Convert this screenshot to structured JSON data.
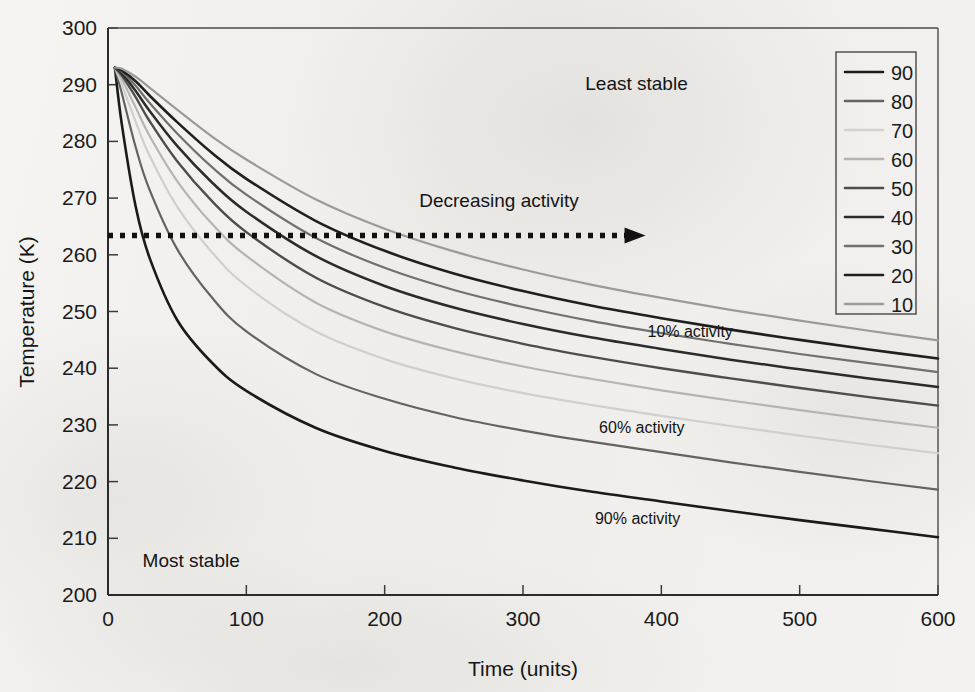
{
  "chart_data": {
    "type": "line",
    "title": "",
    "xlabel": "Time (units)",
    "ylabel": "Temperature (K)",
    "xlim": [
      0,
      600
    ],
    "ylim": [
      200,
      300
    ],
    "xticks": [
      "0",
      "100",
      "200",
      "300",
      "400",
      "500",
      "600"
    ],
    "yticks": [
      "200",
      "210",
      "220",
      "230",
      "240",
      "250",
      "260",
      "270",
      "280",
      "290",
      "300"
    ],
    "grid": false,
    "legend_position": "top-right",
    "legend_title": "",
    "x": [
      5,
      10,
      20,
      30,
      50,
      75,
      100,
      150,
      200,
      250,
      300,
      350,
      400,
      450,
      500,
      550,
      600
    ],
    "series": [
      {
        "name": "90",
        "color": "#1a1a1a",
        "width": 2.6,
        "values": [
          293.0,
          283.0,
          268.5,
          259.5,
          248.5,
          241.0,
          236.0,
          229.5,
          225.4,
          222.5,
          220.2,
          218.2,
          216.5,
          214.8,
          213.2,
          211.7,
          210.2
        ]
      },
      {
        "name": "80",
        "color": "#636363",
        "width": 2.2,
        "values": [
          293.0,
          288.5,
          279.0,
          271.5,
          261.0,
          252.5,
          246.5,
          239.0,
          234.6,
          231.4,
          229.0,
          227.0,
          225.2,
          223.4,
          221.7,
          220.1,
          218.6
        ]
      },
      {
        "name": "70",
        "color": "#cfcfcf",
        "width": 2.2,
        "values": [
          293.0,
          290.0,
          283.5,
          277.5,
          268.5,
          260.5,
          254.5,
          246.5,
          241.6,
          238.2,
          235.6,
          233.5,
          231.6,
          229.8,
          228.1,
          226.5,
          225.0
        ]
      },
      {
        "name": "60",
        "color": "#b4b4b4",
        "width": 2.2,
        "values": [
          293.0,
          291.0,
          286.0,
          281.0,
          273.0,
          265.5,
          259.8,
          251.6,
          246.5,
          243.0,
          240.3,
          238.1,
          236.1,
          234.3,
          232.6,
          231.0,
          229.5
        ]
      },
      {
        "name": "50",
        "color": "#4d4d4d",
        "width": 2.4,
        "values": [
          293.0,
          291.6,
          287.8,
          283.6,
          276.5,
          269.5,
          264.0,
          256.0,
          250.8,
          247.1,
          244.3,
          242.0,
          240.0,
          238.2,
          236.5,
          234.9,
          233.4
        ]
      },
      {
        "name": "40",
        "color": "#2b2b2b",
        "width": 2.5,
        "values": [
          293.0,
          292.0,
          288.9,
          285.4,
          279.2,
          272.8,
          267.6,
          259.8,
          254.5,
          250.7,
          247.8,
          245.4,
          243.4,
          241.5,
          239.8,
          238.2,
          236.7
        ]
      },
      {
        "name": "30",
        "color": "#707070",
        "width": 2.2,
        "values": [
          293.0,
          292.3,
          289.8,
          286.8,
          281.4,
          275.5,
          270.6,
          263.0,
          257.7,
          253.8,
          250.8,
          248.3,
          246.2,
          244.3,
          242.5,
          240.9,
          239.3
        ]
      },
      {
        "name": "20",
        "color": "#1f1f1f",
        "width": 2.6,
        "values": [
          293.0,
          292.5,
          290.6,
          288.1,
          283.4,
          278.0,
          273.4,
          266.0,
          260.7,
          256.7,
          253.6,
          251.0,
          248.8,
          246.8,
          245.0,
          243.3,
          241.7
        ]
      },
      {
        "name": "10",
        "color": "#9a9a9a",
        "width": 2.2,
        "values": [
          293.0,
          292.8,
          291.4,
          289.5,
          285.6,
          280.9,
          276.8,
          269.8,
          264.6,
          260.6,
          257.4,
          254.7,
          252.4,
          250.3,
          248.4,
          246.6,
          244.9
        ]
      }
    ],
    "annotations": [
      {
        "name": "least-stable",
        "text": "Least stable",
        "x": 345,
        "y": 289
      },
      {
        "name": "most-stable",
        "text": "Most stable",
        "x": 25,
        "y": 205
      },
      {
        "name": "decreasing-activity",
        "text": "Decreasing activity",
        "x": 225,
        "y": 268.5
      },
      {
        "name": "label-10-activity",
        "text": "10% activity",
        "x": 390,
        "y": 245.5
      },
      {
        "name": "label-60-activity",
        "text": "60% activity",
        "x": 355,
        "y": 228.5
      },
      {
        "name": "label-90-activity",
        "text": "90% activity",
        "x": 352,
        "y": 212.5
      }
    ],
    "arrow": {
      "name": "decreasing-activity-arrow",
      "style": "dotted",
      "y": 263.4,
      "x_start": 0,
      "x_end": 385,
      "color": "#111111"
    }
  },
  "axes": {
    "y_title": "Temperature (K)",
    "x_title": "Time (units)"
  },
  "legend": {
    "entries": [
      {
        "label": "90",
        "color": "#1a1a1a"
      },
      {
        "label": "80",
        "color": "#636363"
      },
      {
        "label": "70",
        "color": "#d2d2d2"
      },
      {
        "label": "60",
        "color": "#b4b4b4"
      },
      {
        "label": "50",
        "color": "#4d4d4d"
      },
      {
        "label": "40",
        "color": "#2b2b2b"
      },
      {
        "label": "30",
        "color": "#707070"
      },
      {
        "label": "20",
        "color": "#1f1f1f"
      },
      {
        "label": "10",
        "color": "#9a9a9a"
      }
    ]
  }
}
